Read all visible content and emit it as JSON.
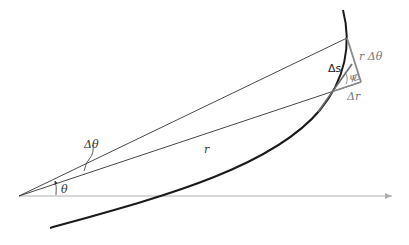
{
  "diagram": {
    "labels": {
      "r": "r",
      "theta": "θ",
      "delta_theta": "Δθ",
      "delta_s": "Δs",
      "r_delta_theta": "r Δθ",
      "delta_r": "Δr",
      "psi": "ψ"
    },
    "colors": {
      "curve": "#1a1a1a",
      "rays": "#333333",
      "axis": "#b0b0b0",
      "triangle": "#8a8a8a",
      "tangent": "#6a6a6a"
    }
  }
}
